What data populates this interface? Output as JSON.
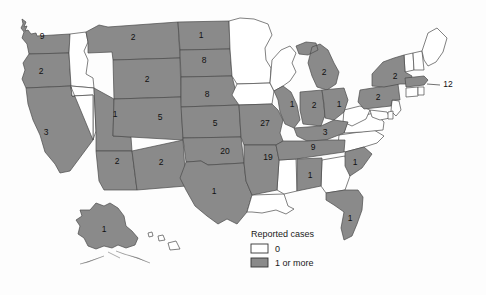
{
  "figure": {
    "title": "",
    "colors": {
      "filled": "#8a8a8a",
      "empty": "#ffffff",
      "border": "#4a4a4a",
      "text": "#111111"
    }
  },
  "legend": {
    "title": "Reported cases",
    "items": [
      {
        "label": "0",
        "swatch": "#ffffff"
      },
      {
        "label": "1 or more",
        "swatch": "#8a8a8a"
      }
    ]
  },
  "chart_data": {
    "type": "map",
    "title": "Reported cases",
    "subtitle": "",
    "xlabel": "",
    "ylabel": "",
    "legend_position": "bottom-center",
    "grid": false,
    "categories": [
      "WA",
      "OR",
      "CA",
      "NV",
      "ID",
      "MT",
      "WY",
      "UT",
      "CO",
      "AZ",
      "NM",
      "ND",
      "SD",
      "NE",
      "KS",
      "OK",
      "TX",
      "MN",
      "IA",
      "MO",
      "AR",
      "LA",
      "WI",
      "IL",
      "MI",
      "IN",
      "OH",
      "KY",
      "TN",
      "MS",
      "AL",
      "GA",
      "FL",
      "SC",
      "NC",
      "VA",
      "WV",
      "MD",
      "DE",
      "PA",
      "NJ",
      "NY",
      "CT",
      "RI",
      "MA",
      "VT",
      "NH",
      "ME",
      "AK",
      "HI"
    ],
    "values": [
      9,
      2,
      3,
      0,
      0,
      2,
      2,
      1,
      5,
      2,
      2,
      1,
      8,
      8,
      5,
      20,
      1,
      0,
      0,
      27,
      19,
      0,
      0,
      1,
      2,
      2,
      1,
      3,
      9,
      0,
      1,
      0,
      1,
      1,
      0,
      0,
      0,
      0,
      0,
      2,
      0,
      2,
      0,
      0,
      12,
      0,
      0,
      0,
      1,
      0
    ],
    "labeled_states": [
      {
        "code": "WA",
        "name": "Washington",
        "value": 9,
        "label": "9",
        "x": 42,
        "y": 37,
        "filled": true
      },
      {
        "code": "OR",
        "name": "Oregon",
        "value": 2,
        "label": "2",
        "x": 41,
        "y": 72,
        "filled": true
      },
      {
        "code": "CA",
        "name": "California",
        "value": 3,
        "label": "3",
        "x": 46,
        "y": 133,
        "filled": true
      },
      {
        "code": "NV",
        "name": "Nevada",
        "value": 0,
        "label": "",
        "x": 74,
        "y": 112,
        "filled": false
      },
      {
        "code": "ID",
        "name": "Idaho",
        "value": 0,
        "label": "",
        "x": 88,
        "y": 60,
        "filled": false
      },
      {
        "code": "MT",
        "name": "Montana",
        "value": 2,
        "label": "2",
        "x": 133,
        "y": 38,
        "filled": true
      },
      {
        "code": "WY",
        "name": "Wyoming",
        "value": 2,
        "label": "2",
        "x": 147,
        "y": 80,
        "filled": true
      },
      {
        "code": "UT",
        "name": "Utah",
        "value": 1,
        "label": "1",
        "x": 115,
        "y": 115,
        "filled": true
      },
      {
        "code": "CO",
        "name": "Colorado",
        "value": 5,
        "label": "5",
        "x": 160,
        "y": 118,
        "filled": true
      },
      {
        "code": "AZ",
        "name": "Arizona",
        "value": 2,
        "label": "2",
        "x": 117,
        "y": 162,
        "filled": true
      },
      {
        "code": "NM",
        "name": "New Mexico",
        "value": 2,
        "label": "2",
        "x": 161,
        "y": 163,
        "filled": true
      },
      {
        "code": "ND",
        "name": "North Dakota",
        "value": 1,
        "label": "1",
        "x": 201,
        "y": 36,
        "filled": true
      },
      {
        "code": "SD",
        "name": "South Dakota",
        "value": 8,
        "label": "8",
        "x": 204,
        "y": 61,
        "filled": true
      },
      {
        "code": "NE",
        "name": "Nebraska",
        "value": 8,
        "label": "8",
        "x": 207,
        "y": 95,
        "filled": true
      },
      {
        "code": "KS",
        "name": "Kansas",
        "value": 5,
        "label": "5",
        "x": 215,
        "y": 124,
        "filled": true
      },
      {
        "code": "OK",
        "name": "Oklahoma",
        "value": 20,
        "label": "20",
        "x": 225,
        "y": 152,
        "filled": true
      },
      {
        "code": "TX",
        "name": "Texas",
        "value": 1,
        "label": "1",
        "x": 214,
        "y": 192,
        "filled": true
      },
      {
        "code": "MN",
        "name": "Minnesota",
        "value": 0,
        "label": "",
        "x": 250,
        "y": 50,
        "filled": false
      },
      {
        "code": "IA",
        "name": "Iowa",
        "value": 0,
        "label": "",
        "x": 254,
        "y": 95,
        "filled": false
      },
      {
        "code": "MO",
        "name": "Missouri",
        "value": 27,
        "label": "27",
        "x": 265,
        "y": 124,
        "filled": true
      },
      {
        "code": "AR",
        "name": "Arkansas",
        "value": 19,
        "label": "19",
        "x": 268,
        "y": 158,
        "filled": true
      },
      {
        "code": "LA",
        "name": "Louisiana",
        "value": 0,
        "label": "",
        "x": 274,
        "y": 186,
        "filled": false
      },
      {
        "code": "WI",
        "name": "Wisconsin",
        "value": 0,
        "label": "",
        "x": 284,
        "y": 58,
        "filled": false
      },
      {
        "code": "IL",
        "name": "Illinois",
        "value": 1,
        "label": "1",
        "x": 292,
        "y": 105,
        "filled": true
      },
      {
        "code": "MI",
        "name": "Michigan",
        "value": 2,
        "label": "2",
        "x": 324,
        "y": 73,
        "filled": true
      },
      {
        "code": "IN",
        "name": "Indiana",
        "value": 2,
        "label": "2",
        "x": 314,
        "y": 106,
        "filled": true
      },
      {
        "code": "OH",
        "name": "Ohio",
        "value": 1,
        "label": "1",
        "x": 339,
        "y": 105,
        "filled": true
      },
      {
        "code": "KY",
        "name": "Kentucky",
        "value": 3,
        "label": "3",
        "x": 325,
        "y": 133,
        "filled": true
      },
      {
        "code": "TN",
        "name": "Tennessee",
        "value": 9,
        "label": "9",
        "x": 313,
        "y": 148,
        "filled": true
      },
      {
        "code": "MS",
        "name": "Mississippi",
        "value": 0,
        "label": "",
        "x": 288,
        "y": 175,
        "filled": false
      },
      {
        "code": "AL",
        "name": "Alabama",
        "value": 1,
        "label": "1",
        "x": 310,
        "y": 176,
        "filled": true
      },
      {
        "code": "GA",
        "name": "Georgia",
        "value": 0,
        "label": "",
        "x": 336,
        "y": 177,
        "filled": false
      },
      {
        "code": "FL",
        "name": "Florida",
        "value": 1,
        "label": "1",
        "x": 350,
        "y": 219,
        "filled": true
      },
      {
        "code": "SC",
        "name": "South Carolina",
        "value": 1,
        "label": "1",
        "x": 355,
        "y": 163,
        "filled": true
      },
      {
        "code": "NC",
        "name": "North Carolina",
        "value": 0,
        "label": "",
        "x": 362,
        "y": 145,
        "filled": false
      },
      {
        "code": "VA",
        "name": "Virginia",
        "value": 0,
        "label": "",
        "x": 365,
        "y": 128,
        "filled": false
      },
      {
        "code": "WV",
        "name": "West Virginia",
        "value": 0,
        "label": "",
        "x": 352,
        "y": 118,
        "filled": false
      },
      {
        "code": "MD",
        "name": "Maryland",
        "value": 0,
        "label": "",
        "x": 378,
        "y": 119,
        "filled": false
      },
      {
        "code": "PA",
        "name": "Pennsylvania",
        "value": 2,
        "label": "2",
        "x": 378,
        "y": 98,
        "filled": true
      },
      {
        "code": "NJ",
        "name": "New Jersey",
        "value": 0,
        "label": "",
        "x": 396,
        "y": 108,
        "filled": false
      },
      {
        "code": "NY",
        "name": "New York",
        "value": 2,
        "label": "2",
        "x": 395,
        "y": 77,
        "filled": true
      },
      {
        "code": "CT",
        "name": "Connecticut",
        "value": 0,
        "label": "",
        "x": 412,
        "y": 93,
        "filled": false
      },
      {
        "code": "RI",
        "name": "Rhode Island",
        "value": 0,
        "label": "",
        "x": 419,
        "y": 90,
        "filled": false
      },
      {
        "code": "MA",
        "name": "Massachusetts",
        "value": 12,
        "label": "12",
        "x": 448,
        "y": 85,
        "filled": true
      },
      {
        "code": "VT",
        "name": "Vermont",
        "value": 0,
        "label": "",
        "x": 409,
        "y": 62,
        "filled": false
      },
      {
        "code": "NH",
        "name": "New Hampshire",
        "value": 0,
        "label": "",
        "x": 419,
        "y": 60,
        "filled": false
      },
      {
        "code": "ME",
        "name": "Maine",
        "value": 0,
        "label": "",
        "x": 436,
        "y": 45,
        "filled": false
      },
      {
        "code": "AK",
        "name": "Alaska",
        "value": 1,
        "label": "1",
        "x": 104,
        "y": 230,
        "filled": true
      },
      {
        "code": "HI",
        "name": "Hawaii",
        "value": 0,
        "label": "",
        "x": 165,
        "y": 240,
        "filled": false
      }
    ]
  }
}
